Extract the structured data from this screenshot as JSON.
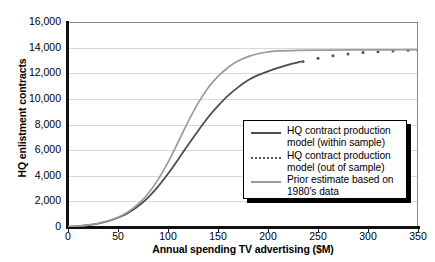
{
  "chart_data": {
    "type": "line",
    "title": "",
    "xlabel": "Annual spending TV advertising ($M)",
    "ylabel": "HQ enlistment contracts",
    "xlim": [
      0,
      350
    ],
    "ylim": [
      0,
      16000
    ],
    "xticks": [
      0,
      50,
      100,
      150,
      200,
      250,
      300,
      350
    ],
    "yticks": [
      0,
      2000,
      4000,
      6000,
      8000,
      10000,
      12000,
      14000,
      16000
    ],
    "ytick_labels": [
      "0",
      "2,000",
      "4,000",
      "6,000",
      "8,000",
      "10,000",
      "12,000",
      "14,000",
      "16,000"
    ],
    "xtick_labels": [
      "0",
      "50",
      "100",
      "150",
      "200",
      "250",
      "300",
      "350"
    ],
    "grid": "horizontal",
    "legend_position": "center-right",
    "series": [
      {
        "name": "HQ contract production model (within sample)",
        "style": "solid",
        "color": "#4d4d4d",
        "width": 1.8,
        "x": [
          0,
          10,
          20,
          30,
          40,
          50,
          60,
          70,
          80,
          90,
          100,
          110,
          120,
          130,
          140,
          150,
          160,
          170,
          180,
          190,
          200,
          210,
          220,
          233
        ],
        "values": [
          20,
          60,
          140,
          260,
          450,
          720,
          1100,
          1620,
          2300,
          3150,
          4150,
          5250,
          6400,
          7500,
          8550,
          9450,
          10250,
          10900,
          11450,
          11850,
          12150,
          12420,
          12650,
          12900
        ]
      },
      {
        "name": "HQ contract production model (out of sample)",
        "style": "dotted",
        "color": "#555555",
        "width": 2.4,
        "x": [
          235,
          250,
          265,
          280,
          295,
          310,
          325,
          340,
          350
        ],
        "values": [
          12920,
          13180,
          13360,
          13500,
          13610,
          13680,
          13740,
          13790,
          13820
        ]
      },
      {
        "name": "Prior estimate based on 1980's data",
        "style": "solid",
        "color": "#9a9a9a",
        "width": 1.7,
        "x": [
          0,
          10,
          20,
          30,
          40,
          50,
          60,
          70,
          80,
          90,
          100,
          110,
          120,
          130,
          140,
          150,
          160,
          170,
          180,
          190,
          200,
          210,
          230,
          260,
          290,
          320,
          350
        ],
        "values": [
          20,
          60,
          140,
          270,
          470,
          760,
          1180,
          1780,
          2600,
          3700,
          5050,
          6600,
          8200,
          9650,
          10850,
          11750,
          12450,
          12950,
          13300,
          13520,
          13660,
          13740,
          13790,
          13810,
          13820,
          13830,
          13840
        ]
      }
    ]
  },
  "legend": {
    "entries": [
      {
        "label": "HQ contract production\nmodel (within sample)",
        "swatch": "solid-dark"
      },
      {
        "label": "HQ contract production\nmodel (out of sample)",
        "swatch": "dotted"
      },
      {
        "label": "Prior estimate based on\n1980's data",
        "swatch": "solid-light"
      }
    ]
  },
  "colors": {
    "within_sample": "#4d4d4d",
    "out_of_sample": "#555555",
    "prior_estimate": "#9a9a9a",
    "axis": "#111111",
    "gridline": "#d9d9d9",
    "background": "#ffffff"
  }
}
